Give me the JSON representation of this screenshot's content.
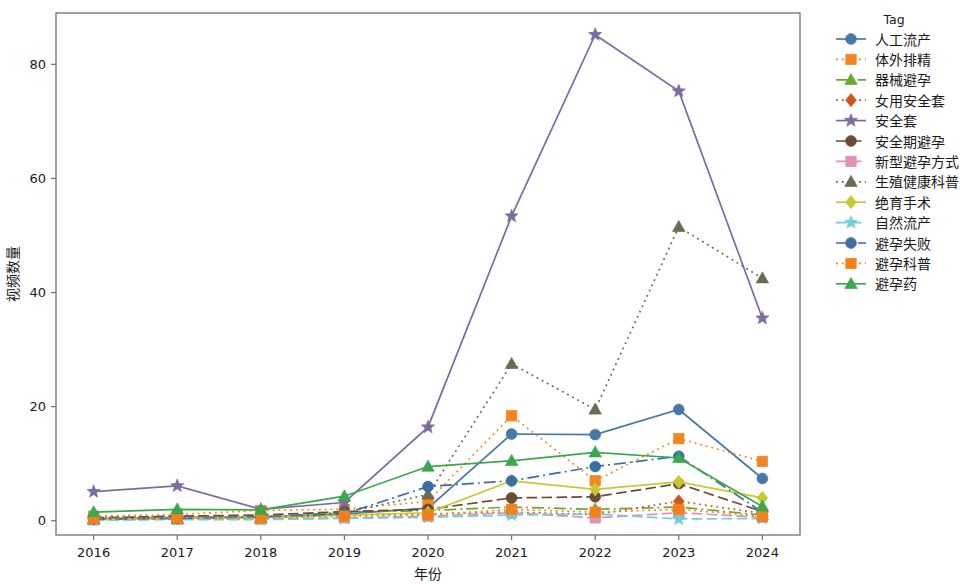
{
  "chart_data": {
    "type": "line",
    "title": "",
    "xlabel": "年份",
    "ylabel": "视频数量",
    "legend_title": "Tag",
    "legend_position": "right",
    "grid": false,
    "x": [
      "2016",
      "2017",
      "2018",
      "2019",
      "2020",
      "2021",
      "2022",
      "2023",
      "2024"
    ],
    "xtick_labels": [
      "2016",
      "2017",
      "2018",
      "2019",
      "2020",
      "2021",
      "2022",
      "2023",
      "2024"
    ],
    "ytick_labels": [
      "0",
      "20",
      "40",
      "60",
      "80"
    ],
    "yticks": [
      0,
      20,
      40,
      60,
      80
    ],
    "ylim": [
      -2.5,
      89
    ],
    "xlim": [
      -0.45,
      8.45
    ],
    "series": [
      {
        "name": "人工流产",
        "color": "#4878a8",
        "marker": "circle",
        "dash": "solid",
        "values": [
          0.3,
          0.6,
          0.6,
          1.2,
          2.2,
          15.2,
          15.1,
          19.5,
          7.4
        ]
      },
      {
        "name": "体外排精",
        "color": "#f5861f",
        "marker": "square",
        "dash": "dotted",
        "values": [
          0.8,
          1.1,
          1.8,
          2.0,
          3.4,
          18.4,
          7.0,
          14.4,
          10.4
        ]
      },
      {
        "name": "器械避孕",
        "color": "#6aa832",
        "marker": "triangle",
        "dash": "dashdot",
        "values": [
          0.4,
          0.5,
          0.6,
          1.5,
          1.8,
          2.4,
          2.0,
          2.4,
          1.0
        ]
      },
      {
        "name": "女用安全套",
        "color": "#d1541f",
        "marker": "diamond",
        "dash": "dotted",
        "values": [
          0.6,
          0.7,
          0.5,
          1.0,
          1.2,
          1.5,
          1.1,
          3.4,
          1.3
        ]
      },
      {
        "name": "安全套",
        "color": "#7c6b9e",
        "marker": "star",
        "dash": "solid",
        "values": [
          5.1,
          6.1,
          2.0,
          3.2,
          16.4,
          53.4,
          85.2,
          75.3,
          35.5
        ]
      },
      {
        "name": "安全期避孕",
        "color": "#6b4b33",
        "marker": "circle",
        "dash": "dashed",
        "values": [
          0.5,
          0.8,
          1.0,
          1.6,
          2.0,
          4.0,
          4.2,
          6.5,
          1.6
        ]
      },
      {
        "name": "新型避孕方式",
        "color": "#e091b4",
        "marker": "square",
        "dash": "dashed",
        "values": [
          0.2,
          0.3,
          0.3,
          0.5,
          0.8,
          1.4,
          0.5,
          1.4,
          0.6
        ]
      },
      {
        "name": "生殖健康科普",
        "color": "#6b6b52",
        "marker": "triangle",
        "dash": "dotted",
        "values": [
          0.2,
          0.3,
          0.4,
          1.4,
          4.6,
          27.5,
          19.5,
          51.5,
          42.5
        ]
      },
      {
        "name": "绝育手术",
        "color": "#c8c832",
        "marker": "diamond",
        "dash": "solid",
        "values": [
          0.2,
          0.4,
          0.5,
          1.0,
          1.4,
          7.0,
          5.5,
          6.8,
          4.0
        ]
      },
      {
        "name": "自然流产",
        "color": "#6ecfd8",
        "marker": "star",
        "dash": "dashed",
        "values": [
          0.1,
          0.2,
          0.2,
          0.4,
          0.6,
          1.0,
          1.2,
          0.3,
          0.4
        ]
      },
      {
        "name": "避孕失败",
        "color": "#3a6ea5",
        "marker": "circle",
        "dash": "dashdot",
        "values": [
          0.3,
          0.4,
          0.7,
          1.2,
          6.0,
          7.0,
          9.5,
          11.3,
          1.5
        ]
      },
      {
        "name": "避孕科普",
        "color": "#f5801a",
        "marker": "square",
        "dash": "dotted",
        "values": [
          0.4,
          0.5,
          0.5,
          0.8,
          1.0,
          2.0,
          1.5,
          2.0,
          0.8
        ]
      },
      {
        "name": "避孕药",
        "color": "#3aa84b",
        "marker": "triangle",
        "dash": "solid",
        "values": [
          1.5,
          2.0,
          1.9,
          4.3,
          9.5,
          10.5,
          12.0,
          11.0,
          2.5
        ]
      }
    ]
  },
  "legend": {
    "title": "Tag",
    "items": [
      {
        "label": "人工流产"
      },
      {
        "label": "体外排精"
      },
      {
        "label": "器械避孕"
      },
      {
        "label": "女用安全套"
      },
      {
        "label": "安全套"
      },
      {
        "label": "安全期避孕"
      },
      {
        "label": "新型避孕方式"
      },
      {
        "label": "生殖健康科普"
      },
      {
        "label": "绝育手术"
      },
      {
        "label": "自然流产"
      },
      {
        "label": "避孕失败"
      },
      {
        "label": "避孕科普"
      },
      {
        "label": "避孕药"
      }
    ]
  }
}
